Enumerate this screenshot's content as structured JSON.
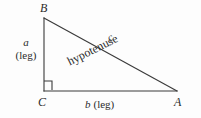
{
  "figure": {
    "name": "right-triangle-diagram",
    "stroke_color": "#3a3a3a",
    "background_color": "#fdfdfd",
    "text_color": "#2b2b2b",
    "vertices": {
      "top_left": {
        "label": "B",
        "x": 44,
        "y": 18
      },
      "bottom_left": {
        "label": "C",
        "x": 44,
        "y": 91
      },
      "bottom_right": {
        "label": "A",
        "x": 177,
        "y": 91
      }
    },
    "right_angle_marker": {
      "name": "right-angle-marker",
      "at_vertex": "C",
      "size": 8
    },
    "sides": {
      "vertical_leg": {
        "variable": "a",
        "descriptor": "(leg)",
        "from": "C",
        "to": "B"
      },
      "horizontal_leg": {
        "variable": "b",
        "descriptor": "(leg)",
        "from": "C",
        "to": "A"
      },
      "hypotenuse": {
        "variable": "c",
        "descriptor": "hypotenuse",
        "from": "B",
        "to": "A"
      }
    },
    "labels": {
      "vertex_a": "A",
      "vertex_b": "B",
      "vertex_c": "C",
      "side_a_var": "a",
      "side_a_leg": "(leg)",
      "side_b_text": "b (leg)",
      "side_b_var": "b",
      "side_b_leg": "(leg)",
      "side_c_var": "c",
      "hypotenuse_word": "hypotenuse"
    }
  }
}
